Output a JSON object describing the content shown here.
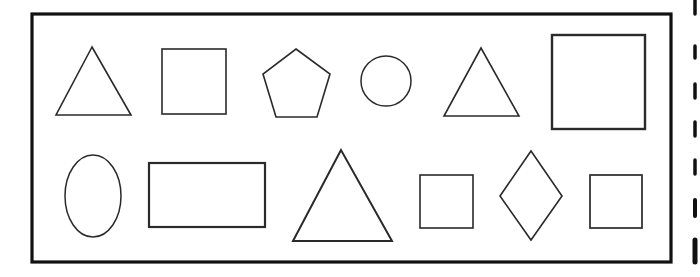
{
  "colors": {
    "background": "#ffffff",
    "stroke": "#2a2a2a",
    "frame": "#111111"
  },
  "frame": {
    "x": 32,
    "y": 14,
    "width": 639,
    "height": 248,
    "stroke_width": 3.2
  },
  "edge_dashes": [
    {
      "x": 695,
      "y1": 0,
      "y2": 14,
      "w": 3.5
    },
    {
      "x": 695,
      "y1": 46,
      "y2": 58,
      "w": 3.5
    },
    {
      "x": 695,
      "y1": 84,
      "y2": 98,
      "w": 3.5
    },
    {
      "x": 695,
      "y1": 122,
      "y2": 136,
      "w": 3.5
    },
    {
      "x": 695,
      "y1": 160,
      "y2": 174,
      "w": 3.5
    },
    {
      "x": 695,
      "y1": 200,
      "y2": 216,
      "w": 4
    },
    {
      "x": 695,
      "y1": 240,
      "y2": 262,
      "w": 5
    }
  ],
  "rows": [
    {
      "name": "row-top",
      "shapes": [
        {
          "type": "triangle",
          "label": "triangle",
          "points": "92,47 56,115 131,115",
          "stroke_width": 1.6
        },
        {
          "type": "square",
          "label": "square",
          "x": 162,
          "y": 49,
          "width": 64,
          "height": 65,
          "stroke_width": 1.6
        },
        {
          "type": "pentagon",
          "label": "pentagon",
          "points": "296,49 330,74 317,117 276,117 263,74",
          "stroke_width": 1.6
        },
        {
          "type": "circle",
          "label": "circle",
          "cx": 386,
          "cy": 81,
          "r": 25,
          "stroke_width": 1.5
        },
        {
          "type": "triangle",
          "label": "triangle",
          "points": "481,48 444,116 519,116",
          "stroke_width": 1.6
        },
        {
          "type": "square",
          "label": "large square",
          "x": 552,
          "y": 35,
          "width": 93,
          "height": 94,
          "stroke_width": 2.4
        }
      ]
    },
    {
      "name": "row-bottom",
      "shapes": [
        {
          "type": "ellipse",
          "label": "oval",
          "cx": 93,
          "cy": 196,
          "rx": 28,
          "ry": 41,
          "stroke_width": 1.5
        },
        {
          "type": "rectangle",
          "label": "rectangle",
          "x": 149,
          "y": 163,
          "width": 116,
          "height": 64,
          "stroke_width": 2.2
        },
        {
          "type": "triangle",
          "label": "large triangle",
          "points": "341,150 293,241 392,241",
          "stroke_width": 2
        },
        {
          "type": "square",
          "label": "small square",
          "x": 420,
          "y": 175,
          "width": 53,
          "height": 53,
          "stroke_width": 1.6
        },
        {
          "type": "diamond",
          "label": "diamond",
          "points": "531,151 562,196 531,240 500,196",
          "stroke_width": 1.6
        },
        {
          "type": "square",
          "label": "small square",
          "x": 590,
          "y": 175,
          "width": 52,
          "height": 53,
          "stroke_width": 1.7
        }
      ]
    }
  ]
}
